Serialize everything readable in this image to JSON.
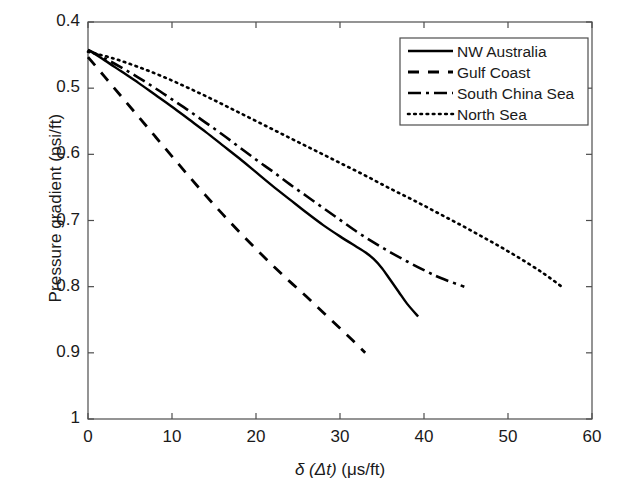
{
  "chart_data": {
    "type": "line",
    "title": "",
    "xlabel": "δ (Δt)  (μs/ft)",
    "xlabel_parts": {
      "delta": "δ",
      "arg": "(Δt)",
      "units": "(μs/ft)"
    },
    "ylabel": "Pressure gradient (psi/ft)",
    "xlim": [
      0,
      60
    ],
    "ylim": [
      1.0,
      0.4
    ],
    "y_inverted": true,
    "xticks": [
      0,
      10,
      20,
      30,
      40,
      50,
      60
    ],
    "xtick_labels": [
      "0",
      "10",
      "20",
      "30",
      "40",
      "50",
      "60"
    ],
    "yticks": [
      0.4,
      0.5,
      0.6,
      0.7,
      0.8,
      0.9,
      1
    ],
    "ytick_labels": [
      "0.4",
      "0.5",
      "0.6",
      "0.7",
      "0.8",
      "0.9",
      "1"
    ],
    "grid": false,
    "legend_position": "upper right",
    "line_color": "#000000",
    "series": [
      {
        "name": "NW Australia",
        "style": "solid",
        "dash": "none",
        "points": [
          [
            0,
            0.442
          ],
          [
            2,
            0.458
          ],
          [
            4,
            0.475
          ],
          [
            6,
            0.492
          ],
          [
            8,
            0.51
          ],
          [
            10,
            0.528
          ],
          [
            12,
            0.547
          ],
          [
            14,
            0.566
          ],
          [
            16,
            0.586
          ],
          [
            18,
            0.606
          ],
          [
            20,
            0.627
          ],
          [
            22,
            0.648
          ],
          [
            24,
            0.668
          ],
          [
            26,
            0.688
          ],
          [
            28,
            0.707
          ],
          [
            30,
            0.724
          ],
          [
            32,
            0.74
          ],
          [
            33,
            0.748
          ],
          [
            34,
            0.758
          ],
          [
            35,
            0.772
          ],
          [
            36,
            0.79
          ],
          [
            37,
            0.808
          ],
          [
            38,
            0.826
          ],
          [
            39.3,
            0.845
          ]
        ]
      },
      {
        "name": "Gulf Coast",
        "style": "dashed",
        "dash": "11,9",
        "points": [
          [
            0,
            0.453
          ],
          [
            2,
            0.483
          ],
          [
            4,
            0.513
          ],
          [
            6,
            0.543
          ],
          [
            8,
            0.573
          ],
          [
            10,
            0.603
          ],
          [
            12,
            0.633
          ],
          [
            14,
            0.662
          ],
          [
            16,
            0.69
          ],
          [
            18,
            0.717
          ],
          [
            20,
            0.743
          ],
          [
            22,
            0.768
          ],
          [
            24,
            0.792
          ],
          [
            26,
            0.815
          ],
          [
            28,
            0.839
          ],
          [
            30,
            0.863
          ],
          [
            31.5,
            0.881
          ],
          [
            33,
            0.9
          ]
        ]
      },
      {
        "name": "South China Sea",
        "style": "dash-dot",
        "dash": "12,5,3,5",
        "points": [
          [
            0,
            0.442
          ],
          [
            2,
            0.455
          ],
          [
            4,
            0.469
          ],
          [
            6,
            0.484
          ],
          [
            8,
            0.5
          ],
          [
            10,
            0.517
          ],
          [
            12,
            0.534
          ],
          [
            14,
            0.552
          ],
          [
            16,
            0.57
          ],
          [
            18,
            0.589
          ],
          [
            20,
            0.608
          ],
          [
            22,
            0.626
          ],
          [
            24,
            0.645
          ],
          [
            26,
            0.663
          ],
          [
            28,
            0.681
          ],
          [
            30,
            0.699
          ],
          [
            32,
            0.717
          ],
          [
            34,
            0.733
          ],
          [
            36,
            0.748
          ],
          [
            38,
            0.762
          ],
          [
            40,
            0.775
          ],
          [
            42,
            0.787
          ],
          [
            44.8,
            0.8
          ]
        ]
      },
      {
        "name": "North Sea",
        "style": "dotted",
        "dash": "2,5",
        "points": [
          [
            0,
            0.445
          ],
          [
            3,
            0.455
          ],
          [
            6,
            0.468
          ],
          [
            9,
            0.483
          ],
          [
            12,
            0.5
          ],
          [
            15,
            0.518
          ],
          [
            18,
            0.537
          ],
          [
            21,
            0.556
          ],
          [
            24,
            0.575
          ],
          [
            27,
            0.594
          ],
          [
            30,
            0.613
          ],
          [
            33,
            0.632
          ],
          [
            36,
            0.652
          ],
          [
            39,
            0.671
          ],
          [
            42,
            0.691
          ],
          [
            45,
            0.711
          ],
          [
            48,
            0.732
          ],
          [
            51,
            0.754
          ],
          [
            54,
            0.778
          ],
          [
            56.4,
            0.8
          ]
        ]
      }
    ]
  },
  "legend": {
    "items": [
      {
        "label": "NW Australia",
        "style": "solid"
      },
      {
        "label": "Gulf Coast",
        "style": "dashed"
      },
      {
        "label": "South China Sea",
        "style": "dash-dot"
      },
      {
        "label": "North Sea",
        "style": "dotted"
      }
    ]
  },
  "axes": {
    "x_label": "δ (Δt)  (μs/ft)",
    "y_label": "Pressure gradient (psi/ft)"
  }
}
